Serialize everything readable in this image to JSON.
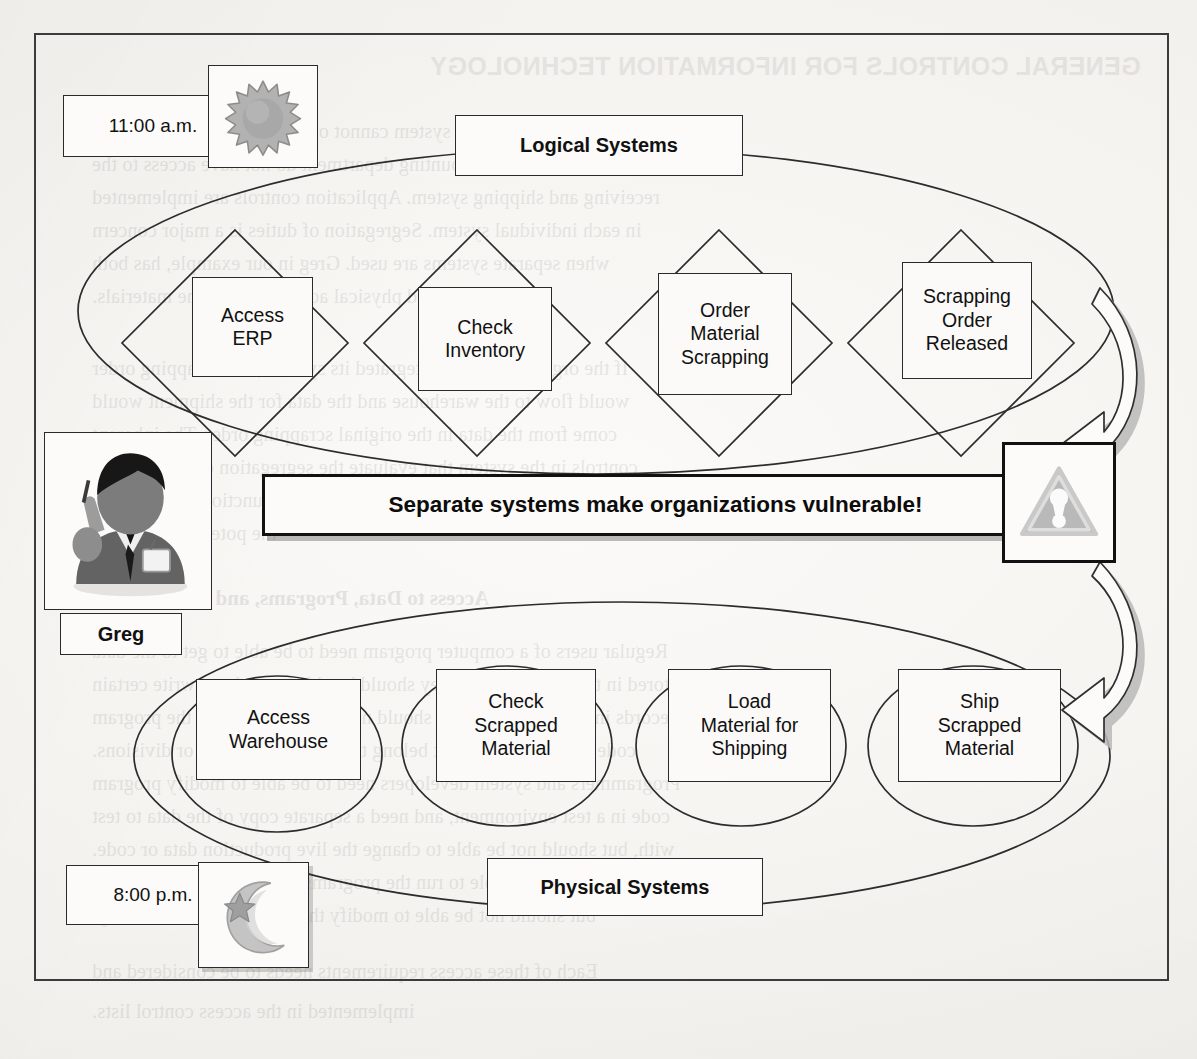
{
  "figure": {
    "title_bleed": "GENERAL CONTROLS FOR INFORMATION TECHNOLOGY",
    "banner_text": "Separate systems make organizations vulnerable!",
    "actor_name": "Greg"
  },
  "colors": {
    "line": "#2c2c2c",
    "banner_border": "#111111",
    "icon_gray": "#a9a9a9",
    "icon_gray_dark": "#6f6f6f",
    "paper": "#f3f2ef"
  },
  "lanes": [
    {
      "id": "logical",
      "label": "Logical Systems",
      "time_label": "11:00 a.m.",
      "time_icon": "sun-icon",
      "shape": "diamond",
      "steps": [
        {
          "label": "Access\nERP"
        },
        {
          "label": "Check\nInventory"
        },
        {
          "label": "Order\nMaterial\nScrapping"
        },
        {
          "label": "Scrapping\nOrder\nReleased"
        }
      ]
    },
    {
      "id": "physical",
      "label": "Physical Systems",
      "time_label": "8:00 p.m.",
      "time_icon": "moon-star-icon",
      "shape": "ellipse",
      "steps": [
        {
          "label": "Access\nWarehouse"
        },
        {
          "label": "Check\nScrapped\nMaterial"
        },
        {
          "label": "Load\nMaterial for\nShipping"
        },
        {
          "label": "Ship\nScrapped\nMaterial"
        }
      ]
    }
  ],
  "icons": {
    "warning": "warning-triangle-icon",
    "person": "businessman-avatar-icon",
    "arrow_top": "curved-arrow-left-icon",
    "arrow_bottom": "curved-arrow-left-icon"
  },
  "bleed_lines": [
    {
      "text": "GENERAL CONTROLS FOR INFORMATION TECHNOLOGY",
      "x": 430,
      "y": 52,
      "cls": "bleed-head"
    },
    {
      "text": "it is functional, so that the system cannot open and post journal entries",
      "x": 92,
      "y": 120,
      "cls": "bleed-serif"
    },
    {
      "text": "and users in the accounting department do not have access to the",
      "x": 92,
      "y": 153,
      "cls": "bleed-serif"
    },
    {
      "text": "receiving and shipping system. Application controls are implemented",
      "x": 92,
      "y": 186,
      "cls": "bleed-serif"
    },
    {
      "text": "in each individual system. Segregation of duties is a major concern",
      "x": 92,
      "y": 219,
      "cls": "bleed-serif"
    },
    {
      "text": "when separate systems are used. Greg in our example, has both",
      "x": 92,
      "y": 252,
      "cls": "bleed-serif"
    },
    {
      "text": "logical and physical access to the same materials.",
      "x": 92,
      "y": 285,
      "cls": "bleed-serif"
    },
    {
      "text": "If the organization had integrated its systems, the scrapping order",
      "x": 92,
      "y": 357,
      "cls": "bleed-serif"
    },
    {
      "text": "would flow to the warehouse and the data for the shipment would",
      "x": 92,
      "y": 390,
      "cls": "bleed-serif"
    },
    {
      "text": "come from the data in the original scrapping order. The inherent",
      "x": 92,
      "y": 423,
      "cls": "bleed-serif"
    },
    {
      "text": "controls in the system that evaluate the segregation of duties could",
      "x": 92,
      "y": 456,
      "cls": "bleed-serif"
    },
    {
      "text": "detect that Greg was performing incompatible functions and prevent",
      "x": 92,
      "y": 489,
      "cls": "bleed-serif"
    },
    {
      "text": "the potential for fraud.",
      "x": 92,
      "y": 522,
      "cls": "bleed-serif"
    },
    {
      "text": "Access to Data, Programs, and Equipment",
      "x": 110,
      "y": 586,
      "cls": "bleed-sub"
    },
    {
      "text": "Regular users of a computer program need to be able to get to the data",
      "x": 92,
      "y": 640,
      "cls": "bleed-serif"
    },
    {
      "text": "stored in the database, and they should be able to read and write certain",
      "x": 92,
      "y": 673,
      "cls": "bleed-serif"
    },
    {
      "text": "records in the database. They should not be able to modify the program",
      "x": 92,
      "y": 706,
      "cls": "bleed-serif"
    },
    {
      "text": "code or read records that belong to other departments or divisions.",
      "x": 92,
      "y": 739,
      "cls": "bleed-serif"
    },
    {
      "text": "Programmers and system developers need to be able to modify program",
      "x": 92,
      "y": 772,
      "cls": "bleed-serif"
    },
    {
      "text": "code in a test environment, and need a separate copy of the data to test",
      "x": 92,
      "y": 805,
      "cls": "bleed-serif"
    },
    {
      "text": "with, but should not be able to change the live production data or code.",
      "x": 92,
      "y": 838,
      "cls": "bleed-serif"
    },
    {
      "text": "Operators must be able to run the programs and monitor their results,",
      "x": 92,
      "y": 871,
      "cls": "bleed-serif"
    },
    {
      "text": "but should not be able to modify the code or the data directly.",
      "x": 92,
      "y": 904,
      "cls": "bleed-serif"
    },
    {
      "text": "Each of these access requirements needs to be considered and",
      "x": 92,
      "y": 960,
      "cls": "bleed-serif"
    },
    {
      "text": "implemented in the access control lists.",
      "x": 92,
      "y": 1000,
      "cls": "bleed-serif"
    }
  ]
}
